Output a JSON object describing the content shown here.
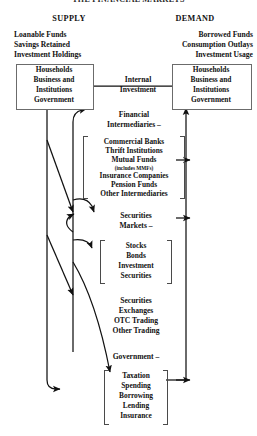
{
  "title": "THE FINANCIAL MARKETS",
  "columns": {
    "supply": {
      "heading": "SUPPLY",
      "lines": [
        "Loanable Funds",
        "Savings Retained",
        "Investment Holdings"
      ]
    },
    "demand": {
      "heading": "DEMAND",
      "lines": [
        "Borrowed Funds",
        "Consumption Outlays",
        "Investment Usage"
      ]
    }
  },
  "sectors": {
    "supply_box": [
      "Households",
      "Business and",
      "Institutions",
      "Government"
    ],
    "demand_box": [
      "Households",
      "Business and",
      "Institutions",
      "Government"
    ]
  },
  "flows": {
    "internal_investment": [
      "Internal",
      "Investment"
    ]
  },
  "channels": [
    {
      "label": [
        "Financial",
        "Intermediaries –"
      ],
      "items": [
        "Commercial Banks",
        "Thrift Institutions",
        "Mutual Funds",
        "Insurance Companies",
        "Pension Funds",
        "Other Intermediaries"
      ],
      "subnote": "(includes MMFs)"
    },
    {
      "label": [
        "Securities",
        "Markets –"
      ],
      "items": [
        "Stocks",
        "Bonds",
        "Investment",
        "Securities"
      ]
    },
    {
      "label": [
        "Securities",
        "Exchanges",
        "OTC Trading",
        "Other Trading"
      ],
      "items": []
    },
    {
      "label": [
        "Government –"
      ],
      "items": [
        "Taxation",
        "Spending",
        "Borrowing",
        "Lending",
        "Insurance"
      ]
    }
  ],
  "colors": {
    "ink": "#111111",
    "line": "#1a1a1a",
    "box_border": "#6b6b6b",
    "bracket": "#4a4a4a",
    "background": "#ffffff"
  }
}
